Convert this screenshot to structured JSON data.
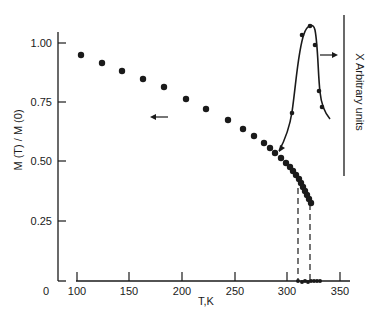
{
  "chart_data": {
    "type": "scatter",
    "title": "",
    "xlabel": "T,K",
    "ylabel": "M (T) / M (0)",
    "right_label": "X Arbitrary units",
    "xlim": [
      85,
      355
    ],
    "ylim": [
      0,
      1.05
    ],
    "x_ticks": [
      100,
      150,
      200,
      250,
      300,
      350
    ],
    "x_tick_labels": [
      "0",
      "100",
      "150",
      "200",
      "250",
      "300",
      "350"
    ],
    "y_ticks": [
      0.25,
      0.5,
      0.75,
      1.0
    ],
    "y_tick_labels": [
      "0.25",
      "0.50",
      "0.75",
      "1.00"
    ],
    "grid": false,
    "legend": null,
    "series": [
      {
        "name": "M(T)/M(0)",
        "style": "markers",
        "axis": "left",
        "x": [
          104,
          124,
          143,
          163,
          183,
          204,
          224,
          245,
          260,
          270,
          280,
          285,
          290,
          295,
          300,
          303,
          306,
          308,
          310,
          312,
          314,
          316,
          318,
          320,
          322
        ],
        "y": [
          0.95,
          0.915,
          0.88,
          0.845,
          0.81,
          0.76,
          0.72,
          0.675,
          0.64,
          0.61,
          0.58,
          0.56,
          0.54,
          0.52,
          0.5,
          0.48,
          0.46,
          0.445,
          0.43,
          0.41,
          0.39,
          0.375,
          0.36,
          0.345,
          0.33
        ]
      },
      {
        "name": "X (susceptibility)",
        "style": "line+markers",
        "axis": "right",
        "x": [
          292,
          302,
          312,
          320,
          324,
          326,
          330,
          336
        ],
        "y": [
          0.49,
          0.64,
          0.97,
          1.06,
          0.99,
          0.79,
          0.73,
          0.68
        ],
        "marker_x": [
          301,
          312,
          320,
          323,
          325
        ],
        "marker_y": [
          0.64,
          0.97,
          1.06,
          0.79,
          0.73
        ]
      }
    ],
    "annotations": [
      {
        "type": "arrow",
        "direction": "left",
        "near_series": "M(T)/M(0)"
      },
      {
        "type": "arrow",
        "direction": "right",
        "near_series": "X (susceptibility)"
      },
      {
        "type": "dashed-vline",
        "x": 309
      },
      {
        "type": "dashed-vline",
        "x": 321
      }
    ],
    "axis_break": "x-axis broken between 0 and 100"
  },
  "render": {
    "color": "#1a1a1a",
    "y_axis": {
      "x": 58,
      "top": 32,
      "bottom": 281
    },
    "x_axis_short": {
      "x1": 58,
      "x2": 66,
      "y": 281
    },
    "x_axis_main": {
      "x1": 76,
      "x2": 350,
      "y": 281
    },
    "right_axis": {
      "x": 344,
      "top": 15,
      "bottom": 176
    },
    "y_ticks_px": [
      {
        "label": "1.00",
        "y": 43
      },
      {
        "label": "0.75",
        "y": 102
      },
      {
        "label": "0.50",
        "y": 161
      },
      {
        "label": "0.25",
        "y": 221
      }
    ],
    "x_ticks_px": [
      {
        "label": "100",
        "x": 77
      },
      {
        "label": "150",
        "x": 129
      },
      {
        "label": "200",
        "x": 182
      },
      {
        "label": "250",
        "x": 235
      },
      {
        "label": "300",
        "x": 287
      },
      {
        "label": "350",
        "x": 340
      }
    ],
    "zero_label": {
      "label": "0",
      "x": 46,
      "y": 295
    },
    "m_points_px": [
      [
        81,
        55
      ],
      [
        102,
        63
      ],
      [
        122,
        71
      ],
      [
        143,
        79
      ],
      [
        164,
        87
      ],
      [
        186,
        99
      ],
      [
        206,
        109
      ],
      [
        228,
        120
      ],
      [
        243,
        129
      ],
      [
        254,
        136
      ],
      [
        264,
        143
      ],
      [
        270,
        148
      ],
      [
        275,
        153
      ],
      [
        281,
        158
      ],
      [
        286,
        163
      ],
      [
        290,
        167
      ],
      [
        293,
        171
      ],
      [
        296,
        175
      ],
      [
        299,
        179
      ],
      [
        301,
        183
      ],
      [
        303,
        187
      ],
      [
        305,
        191
      ],
      [
        307,
        195
      ],
      [
        309,
        199
      ],
      [
        311,
        203
      ]
    ],
    "x_curve_path": "M 279 151 C 286 138, 290 125, 292 112 C 296 85, 298 50, 304 34 C 307 25, 313 22, 315 30 C 318 45, 318 75, 320 92 C 321 102, 324 112, 330 119",
    "x_markers_px": [
      [
        292,
        113
      ],
      [
        302,
        35
      ],
      [
        310,
        26
      ],
      [
        315,
        45
      ],
      [
        319,
        91
      ],
      [
        322,
        107
      ]
    ],
    "left_arrow": {
      "x1": 168,
      "x2": 150,
      "y": 117
    },
    "right_arrow": {
      "x1": 320,
      "x2": 338,
      "y": 55
    },
    "curve_arrow": {
      "x": 281,
      "y": 148
    },
    "dashed_lines": [
      {
        "x": 298,
        "top": 188,
        "bottom": 280
      },
      {
        "x": 310,
        "top": 204,
        "bottom": 280
      }
    ],
    "baseline_dots": [
      [
        298,
        281
      ],
      [
        302,
        282
      ],
      [
        305,
        281
      ],
      [
        308,
        282
      ],
      [
        311,
        281
      ],
      [
        314,
        281
      ],
      [
        317,
        281
      ],
      [
        320,
        281
      ]
    ],
    "xlabel_pos": {
      "x": 206,
      "y": 305
    },
    "ylabel_pos": {
      "x": 22,
      "y": 140
    },
    "right_label_pos": {
      "x": 356,
      "y": 92
    }
  }
}
